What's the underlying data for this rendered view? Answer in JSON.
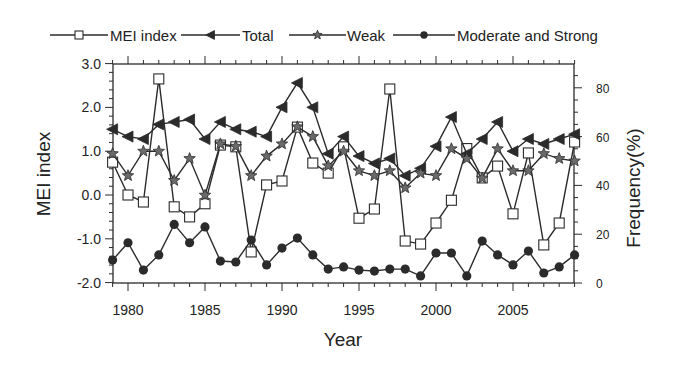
{
  "chart_data": {
    "type": "line",
    "title": "",
    "xlabel": "Year",
    "ylabel": "MEI index",
    "y2label": "Frequency(%)",
    "xlim": [
      1979,
      2009
    ],
    "ylim": [
      -2.0,
      3.0
    ],
    "y2lim": [
      0,
      90
    ],
    "x_ticks": [
      1980,
      1985,
      1990,
      1995,
      2000,
      2005
    ],
    "x_tick_labels": [
      "1980",
      "1985",
      "1990",
      "1995",
      "2000",
      "2005"
    ],
    "y_ticks": [
      3.0,
      2.0,
      1.0,
      0.0,
      -1.0,
      -2.0
    ],
    "y_tick_labels": [
      "3.0",
      "2.0",
      "1.0",
      "0.0",
      "-1.0",
      "-2.0"
    ],
    "y2_ticks": [
      80,
      60,
      40,
      20,
      0
    ],
    "y2_tick_labels": [
      "80",
      "60",
      "40",
      "20",
      "0"
    ],
    "grid": false,
    "legend_position": "top",
    "x": [
      1979,
      1980,
      1981,
      1982,
      1983,
      1984,
      1985,
      1986,
      1987,
      1988,
      1989,
      1990,
      1991,
      1992,
      1993,
      1994,
      1995,
      1996,
      1997,
      1998,
      1999,
      2000,
      2001,
      2002,
      2003,
      2004,
      2005,
      2006,
      2007,
      2008,
      2009
    ],
    "series": [
      {
        "name": "MEI index",
        "axis": "left",
        "marker": "square-open",
        "values": [
          0.75,
          0.0,
          -0.16,
          2.65,
          -0.27,
          -0.5,
          -0.2,
          1.14,
          1.1,
          -1.3,
          0.23,
          0.32,
          1.55,
          0.73,
          0.5,
          1.1,
          -0.53,
          -0.32,
          2.42,
          -1.05,
          -1.12,
          -0.64,
          -0.12,
          1.06,
          0.39,
          0.66,
          -0.43,
          0.96,
          -1.14,
          -0.64,
          1.21
        ]
      },
      {
        "name": "Total",
        "axis": "right",
        "marker": "triangle-left-filled",
        "values": [
          63,
          60,
          59,
          65,
          66,
          67,
          59,
          66,
          63,
          62,
          60,
          72,
          82,
          72,
          53,
          60,
          52,
          49,
          51,
          44,
          47,
          56,
          68,
          53,
          59,
          66,
          54,
          59,
          57,
          59,
          61
        ]
      },
      {
        "name": "Weak",
        "axis": "right",
        "marker": "star",
        "values": [
          53,
          44,
          54,
          54,
          42,
          51,
          36,
          57,
          56,
          44,
          52,
          57,
          64,
          60,
          48,
          54,
          46,
          44,
          46,
          39,
          45,
          44,
          55,
          51,
          43,
          55,
          46,
          46,
          53,
          51,
          50
        ]
      },
      {
        "name": "Moderate and Strong",
        "axis": "right",
        "marker": "circle-filled",
        "values": [
          9.4,
          16.5,
          5.3,
          11.5,
          24,
          16.5,
          23,
          9,
          8.6,
          17.6,
          7.4,
          14.3,
          18.4,
          11.5,
          5.7,
          6.6,
          5.3,
          4.9,
          5.7,
          5.7,
          2.9,
          12.3,
          12.3,
          2.9,
          17.2,
          11.5,
          7.4,
          13.1,
          4.1,
          6.6,
          11.5
        ]
      }
    ]
  },
  "legend": {
    "items": [
      {
        "label": "MEI index",
        "marker": "square-open"
      },
      {
        "label": "Total",
        "marker": "triangle-left-filled"
      },
      {
        "label": "Weak",
        "marker": "star"
      },
      {
        "label": "Moderate and Strong",
        "marker": "circle-filled"
      }
    ]
  },
  "colors": {
    "line": "#2b2b2b",
    "marker_fill": "#2b2b2b",
    "star_fill": "#6a6a6a",
    "background": "#ffffff"
  }
}
